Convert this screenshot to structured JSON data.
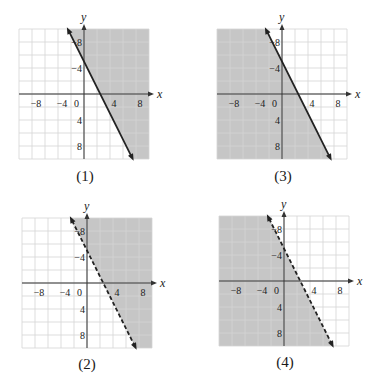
{
  "figure": {
    "panels": [
      {
        "id": "1",
        "caption": "(1)",
        "line_style": "solid",
        "shade": "above"
      },
      {
        "id": "3",
        "caption": "(3)",
        "line_style": "solid",
        "shade": "below"
      },
      {
        "id": "2",
        "caption": "(2)",
        "line_style": "dashed",
        "shade": "above"
      },
      {
        "id": "4",
        "caption": "(4)",
        "line_style": "dashed",
        "shade": "below"
      }
    ],
    "axis_labels": {
      "x": "x",
      "y": "y"
    },
    "x_ticks": [
      "−8",
      "−4",
      "0",
      "4",
      "8"
    ],
    "y_ticks": [
      "8",
      "4",
      "−4",
      "−8"
    ],
    "colors": {
      "shade": "#c6c6c6",
      "grid": "#d4d4d4",
      "grid_on_shade": "#dadada",
      "axis": "#333333",
      "line": "#222222"
    }
  },
  "chart_data": [
    {
      "type": "line",
      "title": "(1)",
      "boundary": "y = -2x + 5",
      "line_style": "solid",
      "shaded_region": "right/above the line (y >= -2x + 5)",
      "xlabel": "x",
      "ylabel": "y",
      "xlim": [
        -10,
        10
      ],
      "ylim": [
        -10,
        10
      ],
      "x_ticks": [
        -8,
        -4,
        0,
        4,
        8
      ],
      "y_ticks": [
        -8,
        -4,
        4,
        8
      ],
      "grid": true,
      "grid_step": 2,
      "points": [
        [
          -2.5,
          10
        ],
        [
          7.5,
          -10
        ]
      ]
    },
    {
      "type": "line",
      "title": "(3)",
      "boundary": "y = -2x + 5",
      "line_style": "solid",
      "shaded_region": "left/below the line (y <= -2x + 5)",
      "xlabel": "x",
      "ylabel": "y",
      "xlim": [
        -10,
        10
      ],
      "ylim": [
        -10,
        10
      ],
      "x_ticks": [
        -8,
        -4,
        0,
        4,
        8
      ],
      "y_ticks": [
        -8,
        -4,
        4,
        8
      ],
      "grid": true,
      "grid_step": 2,
      "points": [
        [
          -2.5,
          10
        ],
        [
          7.5,
          -10
        ]
      ]
    },
    {
      "type": "line",
      "title": "(2)",
      "boundary": "y = -2x + 5",
      "line_style": "dashed",
      "shaded_region": "right/above the line (y > -2x + 5)",
      "xlabel": "x",
      "ylabel": "y",
      "xlim": [
        -10,
        10
      ],
      "ylim": [
        -10,
        10
      ],
      "x_ticks": [
        -8,
        -4,
        0,
        4,
        8
      ],
      "y_ticks": [
        -8,
        -4,
        4,
        8
      ],
      "grid": true,
      "grid_step": 2,
      "points": [
        [
          -2.5,
          10
        ],
        [
          7.5,
          -10
        ]
      ]
    },
    {
      "type": "line",
      "title": "(4)",
      "boundary": "y = -2x + 5",
      "line_style": "dashed",
      "shaded_region": "left/below the line (y < -2x + 5)",
      "xlabel": "x",
      "ylabel": "y",
      "xlim": [
        -10,
        10
      ],
      "ylim": [
        -10,
        10
      ],
      "x_ticks": [
        -8,
        -4,
        0,
        4,
        8
      ],
      "y_ticks": [
        -8,
        -4,
        4,
        8
      ],
      "grid": true,
      "grid_step": 2,
      "points": [
        [
          -2.5,
          10
        ],
        [
          7.5,
          -10
        ]
      ]
    }
  ]
}
